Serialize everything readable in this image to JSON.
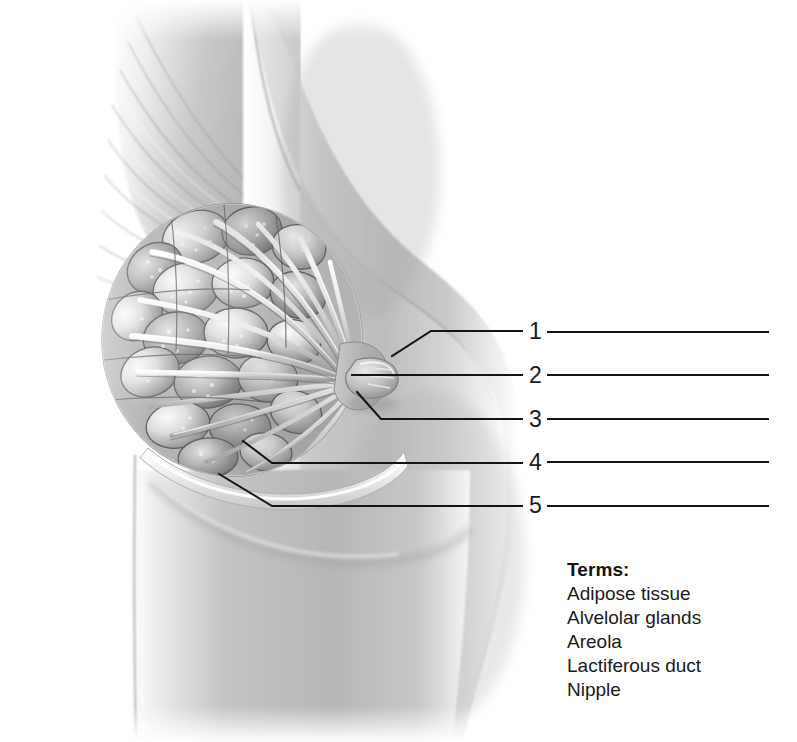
{
  "figure": {
    "orientation": "lateral-sagittal",
    "style": "grayscale-airbrush-medical-illustration"
  },
  "callouts": [
    {
      "number": "1",
      "number_x": 529,
      "number_y": 320,
      "target": "areola"
    },
    {
      "number": "2",
      "number_x": 529,
      "number_y": 364,
      "target": "nipple"
    },
    {
      "number": "3",
      "number_x": 529,
      "number_y": 408,
      "target": "lactiferous-duct"
    },
    {
      "number": "4",
      "number_x": 529,
      "number_y": 451,
      "target": "alveolar-glands"
    },
    {
      "number": "5",
      "number_x": 529,
      "number_y": 494,
      "target": "adipose-tissue"
    }
  ],
  "answer_lines": [
    {
      "number": "1",
      "x1": 548,
      "x2": 768,
      "y": 332
    },
    {
      "number": "2",
      "x1": 548,
      "x2": 768,
      "y": 375
    },
    {
      "number": "3",
      "x1": 548,
      "x2": 768,
      "y": 419
    },
    {
      "number": "4",
      "x1": 548,
      "x2": 768,
      "y": 462
    },
    {
      "number": "5",
      "x1": 548,
      "x2": 768,
      "y": 506
    }
  ],
  "leader_lines": [
    {
      "number": "1",
      "points": "392,356 431,331 522,331"
    },
    {
      "number": "2",
      "points": "352,375 522,375"
    },
    {
      "number": "3",
      "points": "357,392 381,419 522,419"
    },
    {
      "number": "4",
      "points": "243,441 272,463 522,463"
    },
    {
      "number": "5",
      "points": "219,474 272,506 522,506"
    }
  ],
  "terms": {
    "heading": "Terms:",
    "items": [
      "Adipose tissue",
      "Alvelolar glands",
      "Areola",
      "Lactiferous duct",
      "Nipple"
    ]
  },
  "colors": {
    "background": "#ffffff",
    "line": "#141414",
    "text": "#1a1a1a",
    "heading": "#111111",
    "skin_light": "#e8e8e8",
    "skin_mid": "#b9b9b9",
    "skin_dark": "#8e8e8e",
    "gland_light": "#f2f2f2",
    "gland_mid": "#a8a8a8",
    "gland_dark": "#6e6e6e",
    "duct": "#efefef"
  }
}
